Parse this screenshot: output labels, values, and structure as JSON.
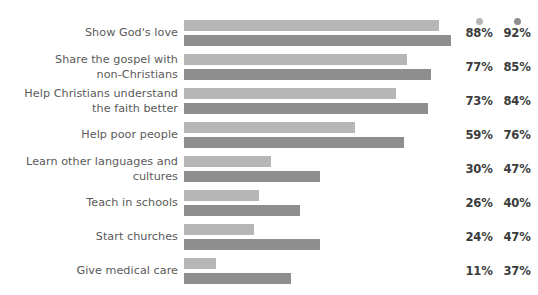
{
  "chart_data": {
    "type": "bar",
    "orientation": "horizontal",
    "title": "",
    "subtitle": "",
    "xlabel": "",
    "ylabel": "",
    "xlim": [
      0,
      100
    ],
    "grid": false,
    "legend_position": "top-right",
    "categories": [
      "Show God's love",
      "Share the gospel with\nnon-Christians",
      "Help Christians understand\nthe faith better",
      "Help poor people",
      "Learn other languages and\ncultures",
      "Teach in schools",
      "Start churches",
      "Give medical care"
    ],
    "series": [
      {
        "name": "series-1",
        "color": "#b6b6b6",
        "values": [
          88,
          77,
          73,
          59,
          30,
          26,
          24,
          11
        ],
        "labels": [
          "88%",
          "77%",
          "73%",
          "59%",
          "30%",
          "26%",
          "24%",
          "11%"
        ]
      },
      {
        "name": "series-2",
        "color": "#8e8e8e",
        "values": [
          92,
          85,
          84,
          76,
          47,
          40,
          47,
          37
        ],
        "labels": [
          "92%",
          "85%",
          "84%",
          "76%",
          "47%",
          "40%",
          "47%",
          "37%"
        ]
      }
    ]
  },
  "legend": {
    "items": [
      {
        "marker": "legend-dot-light",
        "color": "#b6b6b6"
      },
      {
        "marker": "legend-dot-dark",
        "color": "#8e8e8e"
      }
    ]
  },
  "colors": {
    "background": "#ffffff",
    "label_text": "#5a5a5a",
    "value_text": "#3b3b3b",
    "bar_light": "#b6b6b6",
    "bar_dark": "#8e8e8e"
  },
  "scale": {
    "px_per_percent": 2.9,
    "bar_origin_x": 184
  }
}
